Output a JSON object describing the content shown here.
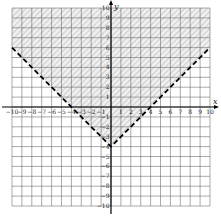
{
  "chart_data": {
    "type": "line",
    "title": "",
    "xlabel": "x",
    "ylabel": "y",
    "xlim": [
      -10,
      10
    ],
    "ylim": [
      -10,
      10
    ],
    "grid": true,
    "x_ticks": [
      -10,
      -9,
      -8,
      -7,
      -6,
      -5,
      -4,
      -3,
      -2,
      -1,
      1,
      2,
      3,
      4,
      5,
      6,
      7,
      8,
      9,
      10
    ],
    "y_ticks": [
      -10,
      -9,
      -8,
      -7,
      -6,
      -5,
      -4,
      -3,
      -2,
      -1,
      1,
      2,
      3,
      4,
      5,
      6,
      7,
      8,
      9,
      10
    ],
    "series": [
      {
        "name": "boundary y = |x| - 4",
        "style": "dashed",
        "color": "#000000",
        "points": [
          [
            -10,
            6
          ],
          [
            0,
            -4
          ],
          [
            10,
            6
          ]
        ]
      }
    ],
    "shaded_region": {
      "description": "region above boundary (y > |x| - 4)",
      "pattern": "diagonal hatch",
      "color": "#d8d8d8"
    },
    "vertex": [
      0,
      -4
    ]
  },
  "labels": {
    "x_axis": "x",
    "y_axis": "y"
  }
}
